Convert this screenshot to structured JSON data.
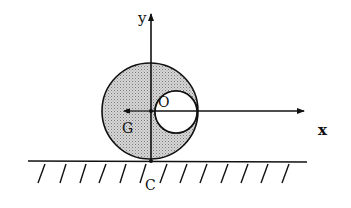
{
  "diagram": {
    "labels": {
      "y_axis": "y",
      "x_axis": "x",
      "center": "O",
      "center_of_mass": "G",
      "contact_point": "C"
    },
    "colors": {
      "ink": "#111111",
      "fill": "#c8c8c8",
      "background": "#ffffff"
    },
    "shapes": {
      "disk": {
        "cx": 150,
        "cy": 111,
        "r": 48
      },
      "hole": {
        "cx": 176,
        "cy": 112,
        "r": 21
      },
      "G_point": {
        "cx": 128,
        "cy": 111
      },
      "ground_y": 161
    }
  }
}
